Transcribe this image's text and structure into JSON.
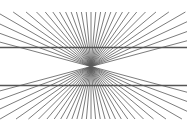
{
  "figure": {
    "name": "Hering illusion",
    "background": "#ffffff",
    "ray_color": "#5a5a5a",
    "ray_width": 0.8,
    "center": {
      "x": 91,
      "y": 66.5
    },
    "bounds": {
      "x0": 0,
      "y0": 12,
      "x1": 187,
      "y1": 119
    },
    "ray_angle_step_deg": 5,
    "ray_angle_min_deg": 15,
    "ray_angle_max_deg": 165,
    "horizontal_lines": [
      {
        "y": 47.5,
        "color": "#555555",
        "width": 1.3
      },
      {
        "y": 85.5,
        "color": "#555555",
        "width": 1.3
      }
    ]
  }
}
